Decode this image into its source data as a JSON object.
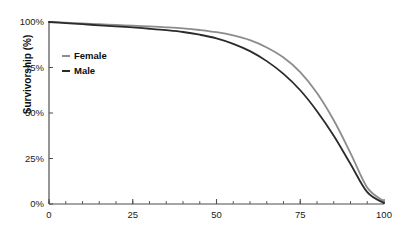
{
  "chart_data": {
    "type": "line",
    "title": "",
    "xlabel": "",
    "ylabel": "Survivorship (%)",
    "xlim": [
      0,
      100
    ],
    "ylim": [
      0,
      100
    ],
    "xticks": [
      "0",
      "25",
      "50",
      "75",
      "100"
    ],
    "xtick_values": [
      0,
      25,
      50,
      75,
      100
    ],
    "yticks": [
      "0%",
      "25%",
      "50%",
      "75%",
      "100%"
    ],
    "ytick_values": [
      0,
      25,
      50,
      75,
      100
    ],
    "x_minor_tick_step": 5,
    "grid": false,
    "legend_position": "upper left",
    "x": [
      0,
      5,
      10,
      15,
      20,
      25,
      30,
      35,
      40,
      45,
      50,
      55,
      60,
      65,
      70,
      75,
      80,
      85,
      90,
      95,
      100
    ],
    "series": [
      {
        "name": "Female",
        "color": "#8c8c8c",
        "values": [
          100,
          99.6,
          99.2,
          98.8,
          98.4,
          98,
          97.6,
          97.1,
          96.5,
          95.6,
          94.4,
          92.6,
          90,
          86,
          80.5,
          72.5,
          61,
          46,
          28,
          9,
          1.5
        ]
      },
      {
        "name": "Male",
        "color": "#2b2b2b",
        "values": [
          100,
          99.4,
          98.8,
          98.2,
          97.6,
          97,
          96.3,
          95.5,
          94.5,
          93,
          91,
          88,
          84,
          78.5,
          71.5,
          62.5,
          51,
          37.5,
          22,
          6.5,
          0.5
        ]
      }
    ]
  },
  "legend": {
    "items": [
      {
        "label": "Female",
        "color": "#8c8c8c"
      },
      {
        "label": "Male",
        "color": "#2b2b2b"
      }
    ]
  },
  "axis": {
    "color": "#4d4d4d",
    "y_title": "Survivorship (%)"
  }
}
